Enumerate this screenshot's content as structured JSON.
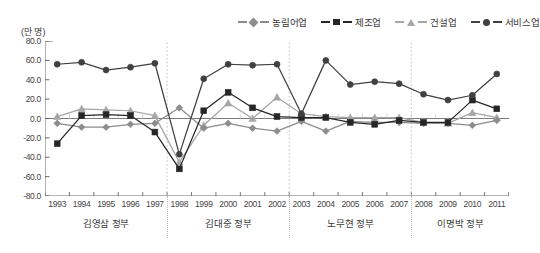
{
  "unit_label": "(만 명)",
  "colors": {
    "farming": "#8c8c8c",
    "manufacturing": "#262626",
    "construction": "#a6a6a6",
    "services": "#404040",
    "axis": "#595959",
    "divider": "#bfbfbf",
    "text": "#3a3a3a"
  },
  "legend": {
    "items": [
      {
        "label": "농림어업",
        "marker": "diamond-marker",
        "color": "#8c8c8c"
      },
      {
        "label": "제조업",
        "marker": "square-marker",
        "color": "#262626"
      },
      {
        "label": "건설업",
        "marker": "triangle-marker",
        "color": "#a6a6a6"
      },
      {
        "label": "서비스업",
        "marker": "circle-marker",
        "color": "#404040"
      }
    ]
  },
  "eras": [
    {
      "label": "김영삼 정부",
      "start_year": 1993,
      "end_year": 1997
    },
    {
      "label": "김대중 정부",
      "start_year": 1998,
      "end_year": 2002
    },
    {
      "label": "노무현 정부",
      "start_year": 2003,
      "end_year": 2007
    },
    {
      "label": "이명박 정부",
      "start_year": 2008,
      "end_year": 2011
    }
  ],
  "chart_data": {
    "type": "line",
    "title": "",
    "xlabel": "",
    "ylabel": "(만 명)",
    "ylim": [
      -80.0,
      80.0
    ],
    "ytick_step": 20.0,
    "yticks": [
      "80.0",
      "60.0",
      "40.0",
      "20.0",
      "0.0",
      "-20.0",
      "-40.0",
      "-60.0",
      "-80.0"
    ],
    "ytick_values": [
      80.0,
      60.0,
      40.0,
      20.0,
      0.0,
      -20.0,
      -40.0,
      -60.0,
      -80.0
    ],
    "grid": false,
    "legend_position": "top-right",
    "categories": [
      1993,
      1994,
      1995,
      1996,
      1997,
      1998,
      1999,
      2000,
      2001,
      2002,
      2003,
      2004,
      2005,
      2006,
      2007,
      2008,
      2009,
      2010,
      2011
    ],
    "xtick_labels": [
      "1993",
      "1994",
      "1995",
      "1996",
      "1997",
      "1998",
      "1999",
      "2000",
      "2001",
      "2002",
      "2003",
      "2004",
      "2005",
      "2006",
      "2007",
      "2008",
      "2009",
      "2010",
      "2011"
    ],
    "series": [
      {
        "name": "농림어업",
        "marker": "diamond",
        "color": "#8c8c8c",
        "values": [
          -5.0,
          -9.0,
          -9.0,
          -6.0,
          -5.0,
          11.0,
          -10.0,
          -5.0,
          -10.0,
          -13.0,
          -3.0,
          -13.0,
          -3.0,
          -4.0,
          -4.0,
          -5.0,
          -5.0,
          -7.0,
          -2.0
        ]
      },
      {
        "name": "제조업",
        "marker": "square",
        "color": "#262626",
        "values": [
          -26.0,
          3.0,
          4.0,
          3.0,
          -14.0,
          -52.0,
          8.0,
          27.0,
          11.0,
          2.0,
          1.0,
          1.0,
          -4.0,
          -6.0,
          -2.0,
          -4.0,
          -4.0,
          19.0,
          10.0
        ]
      },
      {
        "name": "건설업",
        "marker": "triangle",
        "color": "#a6a6a6",
        "values": [
          2.0,
          10.0,
          9.0,
          8.0,
          3.0,
          -45.0,
          -7.0,
          16.0,
          0.0,
          22.0,
          5.0,
          2.0,
          1.0,
          1.0,
          1.0,
          -4.0,
          -5.0,
          6.0,
          1.0
        ]
      },
      {
        "name": "서비스업",
        "marker": "circle",
        "color": "#404040",
        "values": [
          56.0,
          58.0,
          50.0,
          53.0,
          57.0,
          -37.0,
          41.0,
          56.0,
          55.0,
          56.0,
          5.0,
          60.0,
          35.0,
          38.0,
          36.0,
          25.0,
          19.0,
          24.0,
          46.0
        ]
      }
    ]
  }
}
